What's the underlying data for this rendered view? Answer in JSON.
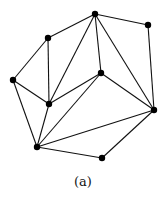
{
  "caption": "(a)",
  "graph": {
    "node_color": "#000000",
    "edge_color": "#111111",
    "nodes": [
      {
        "id": "top",
        "label": ""
      },
      {
        "id": "top-right",
        "label": ""
      },
      {
        "id": "upper-left",
        "label": ""
      },
      {
        "id": "left",
        "label": ""
      },
      {
        "id": "center",
        "label": ""
      },
      {
        "id": "middle-left",
        "label": ""
      },
      {
        "id": "right",
        "label": ""
      },
      {
        "id": "bottom-left",
        "label": ""
      },
      {
        "id": "bottom",
        "label": ""
      }
    ],
    "edges": [
      [
        "top",
        "top-right"
      ],
      [
        "top",
        "upper-left"
      ],
      [
        "top",
        "middle-left"
      ],
      [
        "top",
        "center"
      ],
      [
        "top",
        "right"
      ],
      [
        "top-right",
        "right"
      ],
      [
        "upper-left",
        "left"
      ],
      [
        "upper-left",
        "middle-left"
      ],
      [
        "left",
        "middle-left"
      ],
      [
        "left",
        "bottom-left"
      ],
      [
        "center",
        "middle-left"
      ],
      [
        "center",
        "right"
      ],
      [
        "center",
        "bottom-left"
      ],
      [
        "middle-left",
        "bottom-left"
      ],
      [
        "right",
        "bottom-left"
      ],
      [
        "right",
        "bottom"
      ],
      [
        "bottom-left",
        "bottom"
      ]
    ]
  }
}
